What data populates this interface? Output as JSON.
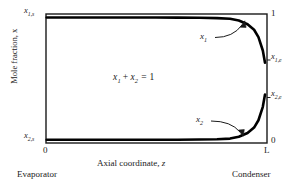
{
  "chart_data": {
    "type": "line",
    "title": "",
    "xlabel": "Axial coordinate, z",
    "ylabel": "Mole fraction, x",
    "xlim": [
      0,
      1
    ],
    "ylim": [
      0,
      1
    ],
    "grid": false,
    "legend": "inline-annotations",
    "x_ticks": [
      {
        "value": 0,
        "label": "0"
      },
      {
        "value": 1,
        "label": "L"
      }
    ],
    "y_ticks_right": [
      {
        "value": 1,
        "label": "1"
      },
      {
        "value": 0,
        "label": "0"
      }
    ],
    "y_ticks_left": [
      {
        "value": 1,
        "label": "x1,s"
      },
      {
        "value": 0,
        "label": "x2,s"
      }
    ],
    "annotations": [
      {
        "text": "x1 + x2 = 1",
        "x": 0.46,
        "y": 0.5
      },
      {
        "text": "x1",
        "x": 0.72,
        "y": 0.82
      },
      {
        "text": "x2",
        "x": 0.7,
        "y": 0.17
      }
    ],
    "section_labels": [
      {
        "text": "Evaporator",
        "x": 0.0
      },
      {
        "text": "Condenser",
        "x": 1.0
      }
    ],
    "series": [
      {
        "name": "x1",
        "start_label": "x1,s",
        "end_label": "x1,e",
        "start_value": 1.0,
        "end_value": 0.63,
        "x": [
          0.0,
          0.1,
          0.2,
          0.3,
          0.4,
          0.5,
          0.6,
          0.7,
          0.78,
          0.84,
          0.88,
          0.92,
          0.95,
          0.97,
          0.99,
          1.0
        ],
        "values": [
          1.0,
          1.0,
          1.0,
          1.0,
          1.0,
          1.0,
          0.999,
          0.998,
          0.995,
          0.99,
          0.975,
          0.945,
          0.9,
          0.84,
          0.73,
          0.63
        ]
      },
      {
        "name": "x2",
        "start_label": "x2,s",
        "end_label": "x2,e",
        "start_value": 0.0,
        "end_value": 0.37,
        "x": [
          0.0,
          0.1,
          0.2,
          0.3,
          0.4,
          0.5,
          0.6,
          0.7,
          0.78,
          0.84,
          0.88,
          0.92,
          0.95,
          0.97,
          0.99,
          1.0
        ],
        "values": [
          0.0,
          0.0,
          0.0,
          0.0,
          0.0,
          0.0,
          0.001,
          0.002,
          0.005,
          0.01,
          0.025,
          0.055,
          0.1,
          0.16,
          0.27,
          0.37
        ]
      }
    ],
    "colors": {
      "frame": "#1a1a1a",
      "curve": "#000000",
      "text": "#1a1a1a",
      "background": "#ffffff"
    }
  },
  "axes": {
    "x_title": "Axial coordinate, z",
    "y_title": "Mole fraction, x",
    "x_tick_left": "0",
    "x_tick_right": "L",
    "y_tick_top_right": "1",
    "y_tick_bottom_right": "0"
  },
  "state_labels": {
    "top_left": {
      "base": "x",
      "sub": "1,s"
    },
    "bottom_left": {
      "base": "x",
      "sub": "2,s"
    },
    "top_right": {
      "base": "x",
      "sub": "1,e"
    },
    "bottom_right": {
      "base": "x",
      "sub": "2,e"
    }
  },
  "callouts": {
    "upper": {
      "base": "x",
      "sub": "1"
    },
    "lower": {
      "base": "x",
      "sub": "2"
    }
  },
  "equation": {
    "term1": "x",
    "term1_sub": "1",
    "plus": "+",
    "term2": "x",
    "term2_sub": "2",
    "equals": "= 1"
  },
  "sections": {
    "left": "Evaporator",
    "right": "Condenser"
  }
}
